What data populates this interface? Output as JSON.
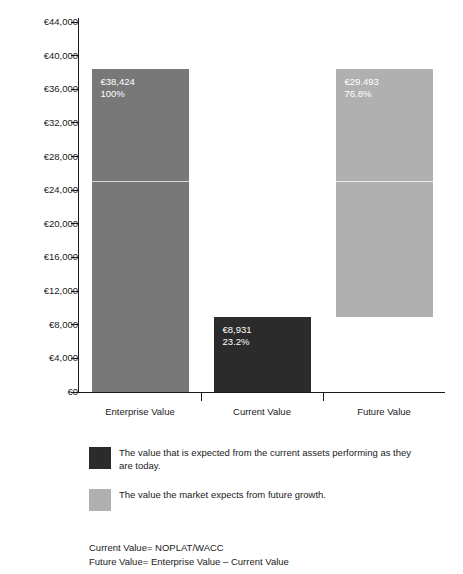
{
  "chart_data": {
    "type": "bar",
    "title": "",
    "subtitle": "",
    "xlabel": "",
    "ylabel": "",
    "categories": [
      "Enterprise Value",
      "Current Value",
      "Future Value"
    ],
    "values": [
      38424,
      8931,
      29493
    ],
    "bases": [
      0,
      0,
      8931
    ],
    "value_labels": [
      "€38,424",
      "€8,931",
      "€29.493"
    ],
    "percent_labels": [
      "100%",
      "23.2%",
      "76.8%"
    ],
    "bar_colors": [
      "#787878",
      "#2b2b2b",
      "#b0b0b0"
    ],
    "ylim": [
      0,
      44000
    ],
    "ytick_step": 4000,
    "ytick_labels": [
      "€44,000",
      "€40,000",
      "€36,000",
      "€32,000",
      "€28,000",
      "€24,000",
      "€20,000",
      "€16,000",
      "€12,000",
      "€8,000",
      "€4,000",
      "€0"
    ],
    "ytick_values": [
      44000,
      40000,
      36000,
      32000,
      28000,
      24000,
      20000,
      16000,
      12000,
      8000,
      4000,
      0
    ],
    "grid": false,
    "legend_position": "below",
    "internal_divider_value": 25100,
    "currency_symbol": "€"
  },
  "legend": {
    "items": [
      {
        "color": "#2b2b2b",
        "text": "The value that is expected from the current assets performing as they are today."
      },
      {
        "color": "#b0b0b0",
        "text": "The value the market expects from future growth."
      }
    ]
  },
  "footnotes": {
    "lines": [
      "Current Value= NOPLAT/WACC",
      "Future Value= Enterprise Value – Current Value"
    ]
  }
}
